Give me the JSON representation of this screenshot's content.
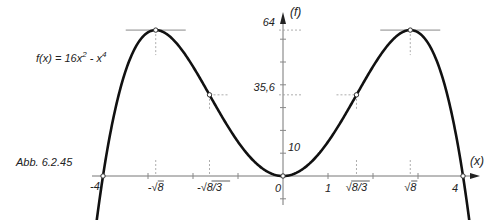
{
  "figure": {
    "caption": "Abb. 6.2.45",
    "function_label": "f(x) = 16x",
    "function_exp1": "2",
    "function_mid": " - x",
    "function_exp2": "4"
  },
  "axes": {
    "x_label": "(x)",
    "y_label": "(f)",
    "x_ticks": [
      {
        "label": "-4",
        "value": -4
      },
      {
        "label": "-√8",
        "value": -2.828
      },
      {
        "label": "-√8/3",
        "value": -1.633
      },
      {
        "label": "0",
        "value": 0
      },
      {
        "label": "1",
        "value": 1
      },
      {
        "label": "√8/3",
        "value": 1.633
      },
      {
        "label": "√8",
        "value": 2.828
      },
      {
        "label": "4",
        "value": 4
      }
    ],
    "y_ticks": [
      {
        "label": "10",
        "value": 10
      },
      {
        "label": "35,6",
        "value": 35.6
      },
      {
        "label": "64",
        "value": 64
      }
    ]
  },
  "chart_data": {
    "type": "line",
    "caption": "Abb. 6.2.45",
    "xlabel": "(x)",
    "ylabel": "(f)",
    "xlim": [
      -4.3,
      4.3
    ],
    "ylim": [
      -15,
      70
    ],
    "grid": false,
    "series": [
      {
        "name": "f(x) = 16x^2 - x^4",
        "x": [
          -4.2,
          -4,
          -3.5,
          -3,
          -2.828,
          -2.5,
          -2,
          -1.633,
          -1,
          -0.5,
          0,
          0.5,
          1,
          1.633,
          2,
          2.5,
          2.828,
          3,
          3.5,
          4,
          4.2
        ],
        "y": [
          -29.0,
          0,
          45.9,
          63,
          64,
          60.9,
          48,
          35.6,
          15,
          3.94,
          0,
          3.94,
          15,
          35.6,
          48,
          60.9,
          64,
          63,
          45.9,
          0,
          -29.0
        ]
      }
    ],
    "marked_points": [
      {
        "name": "zero",
        "x": -4,
        "y": 0
      },
      {
        "name": "maximum",
        "x": -2.828,
        "y": 64
      },
      {
        "name": "inflection",
        "x": -1.633,
        "y": 35.6
      },
      {
        "name": "minimum",
        "x": 0,
        "y": 0
      },
      {
        "name": "inflection",
        "x": 1.633,
        "y": 35.6
      },
      {
        "name": "maximum",
        "x": 2.828,
        "y": 64
      },
      {
        "name": "zero",
        "x": 4,
        "y": 0
      }
    ],
    "x_tick_labels": [
      "-4",
      "-√8",
      "-√8/3",
      "0",
      "1",
      "√8/3",
      "√8",
      "4"
    ],
    "y_tick_labels": [
      "10",
      "35,6",
      "64"
    ]
  }
}
